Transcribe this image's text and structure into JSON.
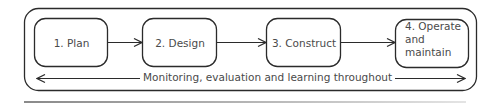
{
  "diagram": {
    "type": "process-flow",
    "stages": [
      {
        "label": "1. Plan"
      },
      {
        "label": "2. Design"
      },
      {
        "label": "3. Construct"
      },
      {
        "label": "4. Operate and maintain",
        "line1": "4. Operate",
        "line2": "and maintain"
      }
    ],
    "loop_label": "Monitoring, evaluation and learning throughout",
    "colors": {
      "stroke": "#2b2b2b",
      "text": "#4a4a4a",
      "rule": "#9a9a9a"
    }
  }
}
